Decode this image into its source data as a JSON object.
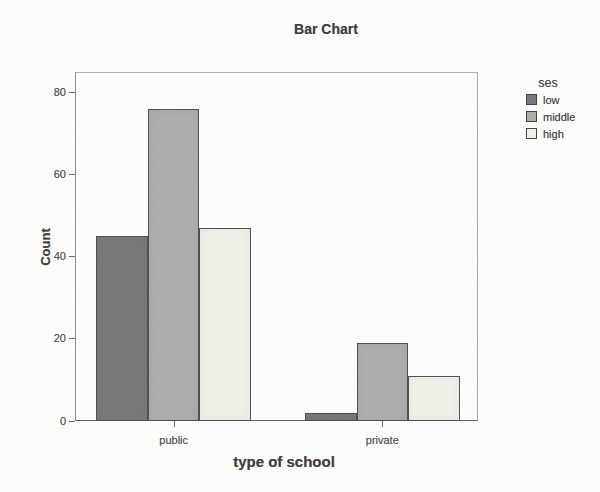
{
  "chart_data": {
    "type": "bar",
    "title": "Bar Chart",
    "categories": [
      "public",
      "private"
    ],
    "series": [
      {
        "name": "low",
        "values": [
          45,
          2
        ],
        "color": "#777777"
      },
      {
        "name": "middle",
        "values": [
          76,
          19
        ],
        "color": "#adadad"
      },
      {
        "name": "high",
        "values": [
          47,
          11
        ],
        "color": "#f2f1ea"
      }
    ],
    "xlabel": "type of school",
    "ylabel": "Count",
    "ylim": [
      0,
      85
    ],
    "yticks": [
      0,
      20,
      40,
      60,
      80
    ],
    "legend_title": "ses",
    "legend_position": "right",
    "grid": false
  },
  "colors": {
    "bar_border": "#4d4d4d",
    "axis": "#5f5f5f",
    "text_dark": "#3a3a3a",
    "text_tick": "#4f4f4f",
    "background": "#fefefc"
  }
}
